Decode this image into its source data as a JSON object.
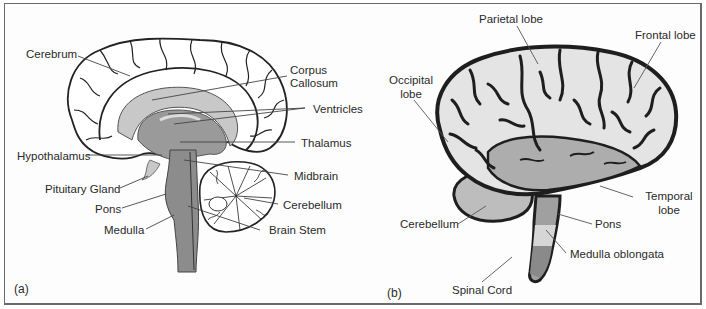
{
  "figure": {
    "panels": [
      {
        "tag": "(a)",
        "view": "Sagittal section of the brain",
        "labels": {
          "cerebrum": "Cerebrum",
          "corpus_callosum_1": "Corpus",
          "corpus_callosum_2": "Callosum",
          "ventricles": "Ventricles",
          "thalamus": "Thalamus",
          "hypothalamus": "Hypothalamus",
          "midbrain": "Midbrain",
          "pituitary": "Pituitary Gland",
          "cerebellum": "Cerebellum",
          "pons": "Pons",
          "brain_stem": "Brain Stem",
          "medulla": "Medulla"
        }
      },
      {
        "tag": "(b)",
        "view": "Lateral view of the brain",
        "labels": {
          "parietal": "Parietal lobe",
          "frontal": "Frontal lobe",
          "occipital_1": "Occipital",
          "occipital_2": "lobe",
          "temporal_1": "Temporal",
          "temporal_2": "lobe",
          "cerebellum": "Cerebellum",
          "pons": "Pons",
          "medulla_oblongata": "Medulla oblongata",
          "spinal_cord": "Spinal Cord"
        }
      }
    ],
    "colors": {
      "outline": "#1e1e1e",
      "light_gray": "#c8c8c8",
      "mid_gray": "#a8a8a8",
      "dark_gray": "#8c8c8c",
      "white_matter": "#ffffff",
      "leader_line": "#555555"
    }
  }
}
